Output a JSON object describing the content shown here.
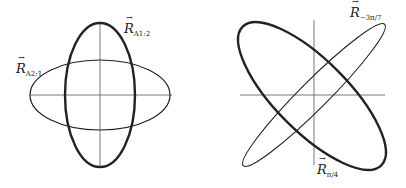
{
  "figure": {
    "left": {
      "axes": {
        "center": [
          100,
          95
        ],
        "x_extent": [
          30,
          172
        ],
        "y_extent": [
          22,
          168
        ]
      },
      "curves": [
        {
          "name": "R_A1:2",
          "label_main": "R",
          "label_sub": "A1:2",
          "cx": 100,
          "cy": 95,
          "rx": 35,
          "ry": 72,
          "rotate": 0,
          "stroke_width": 2.4
        },
        {
          "name": "R_A2:1",
          "label_main": "R",
          "label_sub": "A2:1",
          "cx": 100,
          "cy": 95,
          "rx": 70,
          "ry": 35,
          "rotate": 0,
          "stroke_width": 1.2
        }
      ]
    },
    "right": {
      "axes": {
        "center": [
          114,
          95
        ],
        "x_extent": [
          40,
          185
        ],
        "y_extent": [
          20,
          165
        ]
      },
      "curves": [
        {
          "name": "R_-3pi/7",
          "label_main": "R",
          "label_sub": "−3π/7",
          "cx": 112,
          "cy": 96,
          "rx": 98,
          "ry": 36,
          "rotate": 45,
          "stroke_width": 2.4
        },
        {
          "name": "R_pi/4",
          "label_main": "R",
          "label_sub": "π/4",
          "cx": 114,
          "cy": 95,
          "rx": 100,
          "ry": 14,
          "rotate": -45,
          "stroke_width": 1.1
        }
      ]
    },
    "colors": {
      "stroke": "#222222",
      "axis": "#555555",
      "background": "#ffffff"
    }
  }
}
